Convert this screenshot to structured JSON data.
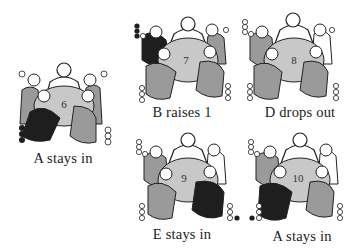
{
  "figure": {
    "title": "",
    "panels": [
      {
        "id": "p6",
        "pot": "6",
        "caption": "A stays in",
        "active_player": "A",
        "active_seat": "front-left",
        "left_stack": {
          "black": 3,
          "white": 0
        },
        "right_stack": {
          "black": 0,
          "white": 3
        },
        "top_left_chip": "white",
        "top_right_chip": "white"
      },
      {
        "id": "p7",
        "pot": "7",
        "caption": "B raises 1",
        "active_player": "B",
        "active_seat": "left",
        "left_stack": {
          "black": 3,
          "white": 1
        },
        "right_stack": {
          "black": 0,
          "white": 3
        },
        "bottom_left_stack": {
          "white": 3
        }
      },
      {
        "id": "p8",
        "pot": "8",
        "caption": "D drops out",
        "active_player": "D",
        "active_seat": "none",
        "left_stack": {
          "white": 4
        },
        "right_stack": {
          "white": 3
        },
        "bottom_left_stack": {
          "white": 3
        }
      },
      {
        "id": "p9",
        "pot": "9",
        "caption": "E stays in",
        "active_player": "E",
        "active_seat": "front-right",
        "left_stack": {
          "white": 4
        },
        "right_stack": {
          "black": 1,
          "white": 2
        },
        "bottom_left_stack": {
          "white": 3
        }
      },
      {
        "id": "p10",
        "pot": "10",
        "caption": "A stays in",
        "active_player": "A",
        "active_seat": "front-left",
        "left_stack": {
          "white": 4
        },
        "right_stack": {
          "white": 3
        },
        "bottom_left_stack": {
          "black": 1,
          "white": 2
        }
      }
    ],
    "colors": {
      "active": "#1e1e1e",
      "player": "#9a9a9a",
      "table": "#c8c8c8",
      "outline": "#222222",
      "background": "#ffffff"
    }
  }
}
